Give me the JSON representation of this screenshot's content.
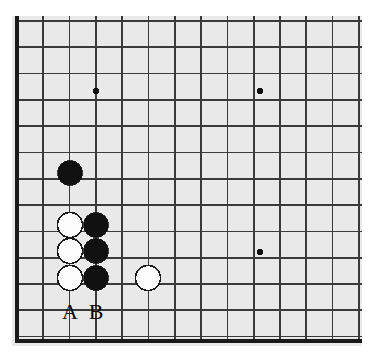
{
  "figure": {
    "kind": "go-board-diagram",
    "board_color": "#e9e9e9",
    "line_color": "#3a3a3a",
    "edge_color": "#1a1a1a",
    "black_stone_color": "#111111",
    "white_stone_color": "#fcfcfc",
    "white_stone_outline": "#1a1a1a",
    "star_point_color": "#111111"
  },
  "geometry": {
    "origin_x": 17,
    "origin_y": 21,
    "cell": 26.3,
    "cols": 14,
    "rows": 13,
    "stone_radius": 12.5,
    "star_radius": 3.2,
    "board_left": 17,
    "board_right": 358,
    "board_top": 21,
    "board_bottom": 341,
    "panel_left": 12,
    "panel_top": 16,
    "panel_right": 362,
    "panel_bottom": 346
  },
  "star_points": [
    {
      "name": "star-point-upper-left",
      "x": 96,
      "y": 91
    },
    {
      "name": "star-point-upper-right",
      "x": 260,
      "y": 91
    },
    {
      "name": "star-point-lower-right",
      "x": 260,
      "y": 252
    }
  ],
  "stones": [
    {
      "id": 1,
      "name": "black-stone-upper",
      "color": "black",
      "x": 70,
      "y": 173
    },
    {
      "id": 2,
      "name": "white-stone-a-top",
      "color": "white",
      "x": 70,
      "y": 225
    },
    {
      "id": 3,
      "name": "black-stone-b-top",
      "color": "black",
      "x": 96,
      "y": 225
    },
    {
      "id": 4,
      "name": "white-stone-a-mid",
      "color": "white",
      "x": 70,
      "y": 251
    },
    {
      "id": 5,
      "name": "black-stone-b-mid",
      "color": "black",
      "x": 96,
      "y": 251
    },
    {
      "id": 6,
      "name": "white-stone-a-bottom",
      "color": "white",
      "x": 70,
      "y": 278
    },
    {
      "id": 7,
      "name": "black-stone-b-bottom",
      "color": "black",
      "x": 96,
      "y": 278
    },
    {
      "id": 8,
      "name": "white-stone-right",
      "color": "white",
      "x": 148,
      "y": 278
    }
  ],
  "coordinate_labels": [
    {
      "name": "point-label-a",
      "text": "A",
      "x": 70,
      "y": 312
    },
    {
      "name": "point-label-b",
      "text": "B",
      "x": 96,
      "y": 312
    }
  ]
}
